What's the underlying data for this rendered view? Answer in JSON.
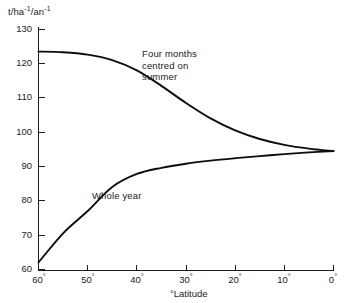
{
  "chart_data": {
    "type": "line",
    "title": "",
    "xlabel": "°Latitude",
    "ylabel": "t/ha⁻¹/an⁻¹",
    "ylabel_parts": {
      "base1": "t/ha",
      "exp1": "-1",
      "sep": "/an",
      "exp2": "-1"
    },
    "xlim": [
      60,
      0
    ],
    "ylim": [
      60,
      130
    ],
    "x_reversed": true,
    "grid": false,
    "legend": "inline-annotations",
    "xticks": [
      60,
      50,
      40,
      30,
      20,
      10,
      0
    ],
    "xtick_labels": [
      "60°",
      "50°",
      "40°",
      "30°",
      "20°",
      "10°",
      "0°"
    ],
    "yticks": [
      60,
      70,
      80,
      90,
      100,
      110,
      120,
      130
    ],
    "ytick_labels": [
      "60",
      "70",
      "80",
      "90",
      "100",
      "110",
      "120",
      "130"
    ],
    "line_color": "#0d0d0d",
    "axis_color": "#1a1a1a",
    "background": "#ffffff",
    "series": [
      {
        "name": "Four months centred on summer",
        "annotation": [
          "Four months",
          "centred on",
          "summer"
        ],
        "x": [
          60,
          55,
          50,
          45,
          40,
          35,
          30,
          25,
          20,
          15,
          10,
          5,
          0
        ],
        "values": [
          123.5,
          123.3,
          122.6,
          121.0,
          118.0,
          113.5,
          108.5,
          104.0,
          100.5,
          98.0,
          96.3,
          95.2,
          94.5
        ]
      },
      {
        "name": "Whole year",
        "annotation": [
          "Whole year"
        ],
        "x": [
          60,
          55,
          50,
          45,
          40,
          35,
          30,
          25,
          20,
          15,
          10,
          5,
          0
        ],
        "values": [
          62.0,
          70.5,
          77.0,
          84.0,
          87.8,
          89.6,
          90.8,
          91.7,
          92.4,
          93.0,
          93.6,
          94.1,
          94.5
        ]
      }
    ]
  },
  "axis_labels": {
    "y_unit_base1": "t/ha",
    "y_unit_exp1": "-1",
    "y_unit_sep": "/an",
    "y_unit_exp2": "-1",
    "x_title": "°Latitude"
  },
  "ytick_text": {
    "t130": "130",
    "t120": "120",
    "t110": "110",
    "t100": "100",
    "t90": "90",
    "t80": "80",
    "t70": "70",
    "t60": "60"
  },
  "xtick_text": {
    "t60": "60",
    "t50": "50",
    "t40": "40",
    "t30": "30",
    "t20": "20",
    "t10": "10",
    "t0": "0",
    "degree": "°"
  },
  "annotations": {
    "summer_l1": "Four months",
    "summer_l2": "centred on",
    "summer_l3": "summer",
    "whole_year": "Whole year"
  }
}
